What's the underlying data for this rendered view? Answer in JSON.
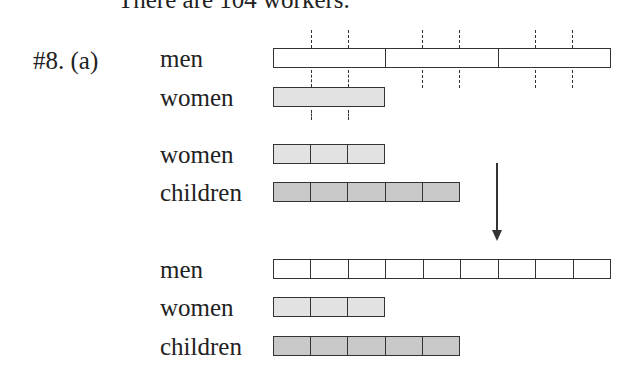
{
  "header": {
    "text": "There are 104 workers."
  },
  "problem": {
    "label": "#8. (a)"
  },
  "colors": {
    "men": "#ffffff",
    "women": "#e2e2e2",
    "children": "#c8c8c8",
    "stroke": "#333333"
  },
  "diagram_top": {
    "rows": [
      {
        "label": "men",
        "units": 3
      },
      {
        "label": "women",
        "units": 1
      }
    ]
  },
  "diagram_middle": {
    "rows": [
      {
        "label": "women",
        "units": 3
      },
      {
        "label": "children",
        "units": 5
      }
    ]
  },
  "diagram_bottom": {
    "rows": [
      {
        "label": "men",
        "units": 9
      },
      {
        "label": "women",
        "units": 3
      },
      {
        "label": "children",
        "units": 5
      }
    ]
  }
}
